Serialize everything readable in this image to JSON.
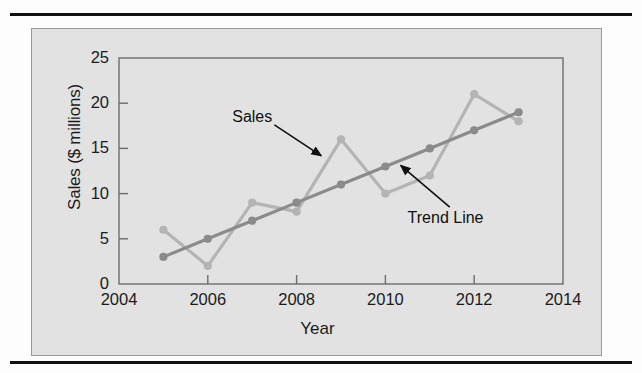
{
  "page": {
    "background_color": "#fdfdfd",
    "rule_color": "#111111",
    "panel_color": "#e2e2e2",
    "panel_border_color": "#9a9a9a"
  },
  "chart_data": {
    "type": "line",
    "title": "",
    "subtitle": "",
    "xlabel": "Year",
    "ylabel": "Sales ($ millions)",
    "x": [
      2005,
      2006,
      2007,
      2008,
      2009,
      2010,
      2011,
      2012,
      2013
    ],
    "xlim": [
      2004,
      2014
    ],
    "ylim": [
      0,
      25
    ],
    "xticks": [
      2004,
      2006,
      2008,
      2010,
      2012,
      2014
    ],
    "xtick_labels": [
      "2004",
      "2006",
      "2008",
      "2010",
      "2012",
      "2014"
    ],
    "yticks": [
      0,
      5,
      10,
      15,
      20,
      25
    ],
    "ytick_labels": [
      "0",
      "5",
      "10",
      "15",
      "20",
      "25"
    ],
    "grid": false,
    "legend_position": "none",
    "series": [
      {
        "name": "Sales",
        "color": "#b4b4b4",
        "marker": "circle",
        "values": [
          6,
          2,
          9,
          8,
          16,
          10,
          12,
          21,
          18
        ]
      },
      {
        "name": "Trend Line",
        "color": "#8b8b8b",
        "marker": "circle",
        "values": [
          3,
          5,
          7,
          9,
          11,
          13,
          15,
          17,
          19
        ]
      }
    ],
    "annotations": [
      {
        "text": "Sales",
        "label_x": 2006.55,
        "label_y": 18.2,
        "arrow_from_x": 2007.5,
        "arrow_from_y": 17.6,
        "arrow_to_x": 2008.55,
        "arrow_to_y": 14.2
      },
      {
        "text": "Trend Line",
        "label_x": 2010.5,
        "label_y": 7.1,
        "arrow_from_x": 2011.45,
        "arrow_from_y": 8.5,
        "arrow_to_x": 2010.35,
        "arrow_to_y": 13.1
      }
    ]
  }
}
